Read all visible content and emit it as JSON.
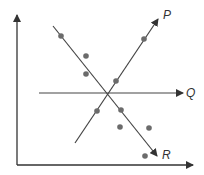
{
  "diagram": {
    "type": "scatter-with-lines",
    "colors": {
      "line": "#444444",
      "dot": "#6b6b6b",
      "axis": "#333333"
    },
    "axes": {
      "y_axis": {
        "x": 17,
        "y1": 165,
        "y2": 15
      },
      "x_axis": {
        "y": 165,
        "x1": 17,
        "x2": 193
      }
    },
    "lines": [
      {
        "id": "P",
        "label": "P",
        "x1": 75,
        "y1": 143,
        "x2": 158,
        "y2": 19,
        "label_x": 163,
        "label_y": 19
      },
      {
        "id": "Q",
        "label": "Q",
        "x1": 39,
        "y1": 93,
        "x2": 183,
        "y2": 93,
        "label_x": 186,
        "label_y": 97
      },
      {
        "id": "R",
        "label": "R",
        "x1": 53,
        "y1": 26,
        "x2": 157,
        "y2": 156,
        "label_x": 162,
        "label_y": 159
      }
    ],
    "points": [
      {
        "x": 61,
        "y": 36
      },
      {
        "x": 86,
        "y": 56
      },
      {
        "x": 86,
        "y": 74
      },
      {
        "x": 144,
        "y": 39
      },
      {
        "x": 116,
        "y": 81
      },
      {
        "x": 97,
        "y": 111
      },
      {
        "x": 121,
        "y": 110
      },
      {
        "x": 120,
        "y": 127
      },
      {
        "x": 149,
        "y": 128
      },
      {
        "x": 145,
        "y": 156
      }
    ]
  },
  "labels": {
    "p": "P",
    "q": "Q",
    "r": "R"
  }
}
